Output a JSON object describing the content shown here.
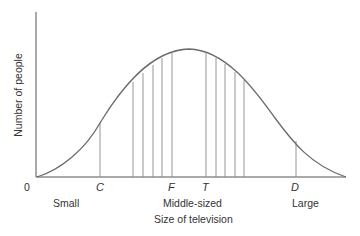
{
  "diagram": {
    "type": "normal-distribution-curve",
    "y_axis_label": "Number of people",
    "x_axis_label": "Size of television",
    "origin_label": "0",
    "tick_labels": [
      {
        "id": "C",
        "label": "C"
      },
      {
        "id": "F",
        "label": "F"
      },
      {
        "id": "T",
        "label": "T"
      },
      {
        "id": "D",
        "label": "D"
      }
    ],
    "category_labels": {
      "small": "Small",
      "middle": "Middle-sized",
      "large": "Large"
    },
    "colors": {
      "curve": "#6b6b6b",
      "axis": "#555555",
      "lines": "#8a8a8a",
      "text": "#333333"
    }
  }
}
